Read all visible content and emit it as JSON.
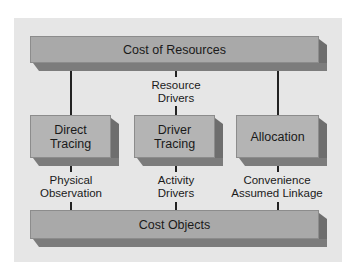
{
  "diagram": {
    "top": {
      "label": "Cost of Resources"
    },
    "middle_label": {
      "line1": "Resource",
      "line2": "Drivers"
    },
    "methods": [
      {
        "line1": "Direct",
        "line2": "Tracing"
      },
      {
        "line1": "Driver",
        "line2": "Tracing"
      },
      {
        "line1": "Allocation",
        "line2": ""
      }
    ],
    "links": [
      {
        "line1": "Physical",
        "line2": "Observation"
      },
      {
        "line1": "Activity",
        "line2": "Drivers"
      },
      {
        "line1": "Convenience",
        "line2": "Assumed Linkage"
      }
    ],
    "bottom": {
      "label": "Cost Objects"
    },
    "colors": {
      "background_panel": "#e6e6e6",
      "box_face": "#a9a9a9",
      "box_shade": "#6e6e6e",
      "connector": "#222222"
    }
  }
}
